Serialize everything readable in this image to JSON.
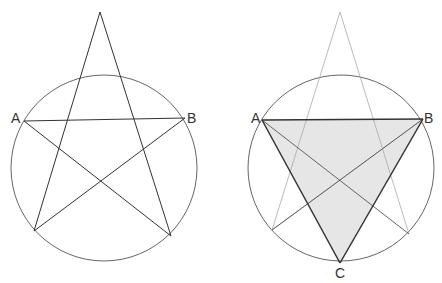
{
  "figure": {
    "left_diagram": {
      "description": "Pentagram inscribed around a circle with points A and B",
      "labels": {
        "a": "A",
        "b": "B"
      }
    },
    "right_diagram": {
      "description": "Pentagram (faded) with shaded equilateral triangle ABC inscribed in circle",
      "labels": {
        "a": "A",
        "b": "B",
        "c": "C"
      },
      "shade_color": "#e6e6e6"
    },
    "colors": {
      "stroke": "#333333",
      "circle": "#555555",
      "faded_stroke": "#aaaaaa"
    }
  }
}
